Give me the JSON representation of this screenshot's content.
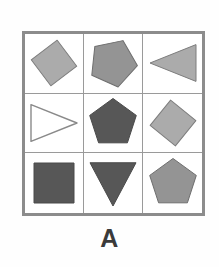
{
  "figure": {
    "caption": "A",
    "panel_label": "A",
    "background_color": "#fefefe",
    "frame_color": "#8c8c8c",
    "gridline_color": "#9a9a9a",
    "grid_rows": 3,
    "grid_cols": 3,
    "palette": {
      "light_gray": "#ababab",
      "medium_gray": "#949494",
      "dark_gray": "#575757",
      "white_fill": "#ffffff",
      "outline": "#6e6e6e"
    }
  },
  "cells": [
    {
      "position": "row1-col1",
      "row": 1,
      "col": 1,
      "shape": "diamond",
      "shape_label": "diamond",
      "fill": "#ababab",
      "fill_name": "light-gray",
      "stroke": "#7d7d7d",
      "rotation_deg": 8,
      "size": 46,
      "filled": true
    },
    {
      "position": "row1-col2",
      "row": 1,
      "col": 2,
      "shape": "pentagon",
      "shape_label": "pentagon",
      "fill": "#949494",
      "fill_name": "medium-gray",
      "stroke": "#6e6e6e",
      "rotation_deg": 24,
      "size": 50,
      "filled": true
    },
    {
      "position": "row1-col3",
      "row": 1,
      "col": 3,
      "shape": "triangle-left",
      "shape_label": "triangle pointing left",
      "fill": "#ababab",
      "fill_name": "light-gray",
      "stroke": "#7d7d7d",
      "rotation_deg": 0,
      "size": 46,
      "filled": true
    },
    {
      "position": "row2-col1",
      "row": 2,
      "col": 1,
      "shape": "triangle-right",
      "shape_label": "triangle pointing right",
      "fill": "#ffffff",
      "fill_name": "white",
      "stroke": "#8a8a8a",
      "rotation_deg": 0,
      "size": 46,
      "filled": false
    },
    {
      "position": "row2-col2",
      "row": 2,
      "col": 2,
      "shape": "pentagon",
      "shape_label": "pentagon",
      "fill": "#575757",
      "fill_name": "dark-gray",
      "stroke": "#4a4a4a",
      "rotation_deg": 0,
      "size": 50,
      "filled": true
    },
    {
      "position": "row2-col3",
      "row": 2,
      "col": 3,
      "shape": "diamond",
      "shape_label": "diamond",
      "fill": "#ababab",
      "fill_name": "light-gray",
      "stroke": "#7d7d7d",
      "rotation_deg": -6,
      "size": 46,
      "filled": true
    },
    {
      "position": "row3-col1",
      "row": 3,
      "col": 1,
      "shape": "square",
      "shape_label": "square",
      "fill": "#575757",
      "fill_name": "dark-gray",
      "stroke": "#4a4a4a",
      "rotation_deg": 0,
      "size": 40,
      "filled": true
    },
    {
      "position": "row3-col2",
      "row": 3,
      "col": 2,
      "shape": "triangle-down",
      "shape_label": "triangle pointing down",
      "fill": "#575757",
      "fill_name": "dark-gray",
      "stroke": "#4a4a4a",
      "rotation_deg": 0,
      "size": 46,
      "filled": true
    },
    {
      "position": "row3-col3",
      "row": 3,
      "col": 3,
      "shape": "pentagon",
      "shape_label": "pentagon",
      "fill": "#949494",
      "fill_name": "medium-gray",
      "stroke": "#6e6e6e",
      "rotation_deg": 0,
      "size": 50,
      "filled": true
    }
  ]
}
